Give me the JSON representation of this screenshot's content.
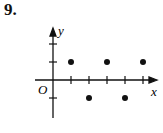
{
  "problem_number": "9.",
  "chart_data": {
    "type": "scatter",
    "title": "",
    "xlabel": "x",
    "ylabel": "y",
    "origin_label": "O",
    "points": [
      {
        "x": 1,
        "y": 1
      },
      {
        "x": 2,
        "y": -1
      },
      {
        "x": 3,
        "y": 1
      },
      {
        "x": 4,
        "y": -1
      },
      {
        "x": 5,
        "y": 1
      }
    ],
    "x_ticks": [
      1,
      2,
      3,
      4,
      5
    ],
    "y_ticks": [
      -1,
      1,
      2
    ],
    "xlim": [
      -1,
      5.8
    ],
    "ylim": [
      -2,
      3
    ],
    "grid": false
  },
  "colors": {
    "ink": "#111111"
  }
}
